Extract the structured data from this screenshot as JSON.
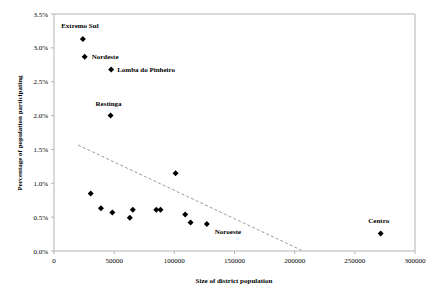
{
  "chart_data": {
    "type": "scatter",
    "title": "",
    "xlabel": "Size of district population",
    "ylabel": "Percentage of population participating",
    "xlim": [
      0,
      300000
    ],
    "ylim": [
      0,
      0.035
    ],
    "grid": false,
    "legend": null,
    "xticks": [
      0,
      50000,
      100000,
      150000,
      200000,
      250000,
      300000
    ],
    "xticklabels": [
      "0",
      "50000",
      "100000",
      "150000",
      "200000",
      "250000",
      "300000"
    ],
    "yticks": [
      0.0,
      0.005,
      0.01,
      0.015,
      0.02,
      0.025,
      0.03,
      0.035
    ],
    "yticklabels": [
      "0.0%",
      "0.5%",
      "1.0%",
      "1.5%",
      "2.0%",
      "2.5%",
      "3.0%",
      "3.5%"
    ],
    "points": [
      {
        "x": 24000,
        "y": 0.0313,
        "label": "Extremo Sul",
        "label_dx": -3,
        "label_dy": -11
      },
      {
        "x": 25500,
        "y": 0.0287,
        "label": "Nordeste",
        "label_dx": 7,
        "label_dy": 2
      },
      {
        "x": 47500,
        "y": 0.0268,
        "label": "Lomba do Pinheiro",
        "label_dx": 6,
        "label_dy": 2
      },
      {
        "x": 47000,
        "y": 0.02,
        "label": "Restinga",
        "label_dx": -2,
        "label_dy": -10
      },
      {
        "x": 30500,
        "y": 0.0085,
        "label": "",
        "label_dx": 0,
        "label_dy": 0
      },
      {
        "x": 39000,
        "y": 0.0063,
        "label": "",
        "label_dx": 0,
        "label_dy": 0
      },
      {
        "x": 48500,
        "y": 0.0057,
        "label": "",
        "label_dx": 0,
        "label_dy": 0
      },
      {
        "x": 63000,
        "y": 0.0049,
        "label": "",
        "label_dx": 0,
        "label_dy": 0
      },
      {
        "x": 65500,
        "y": 0.0061,
        "label": "",
        "label_dx": 0,
        "label_dy": 0
      },
      {
        "x": 85000,
        "y": 0.0061,
        "label": "",
        "label_dx": 0,
        "label_dy": 0
      },
      {
        "x": 88500,
        "y": 0.0061,
        "label": "",
        "label_dx": 0,
        "label_dy": 0
      },
      {
        "x": 101000,
        "y": 0.0115,
        "label": "",
        "label_dx": 0,
        "label_dy": 0
      },
      {
        "x": 109000,
        "y": 0.0054,
        "label": "",
        "label_dx": 0,
        "label_dy": 0
      },
      {
        "x": 113500,
        "y": 0.0042,
        "label": "",
        "label_dx": 0,
        "label_dy": 0
      },
      {
        "x": 127000,
        "y": 0.004,
        "label": "Noroeste",
        "label_dx": 8,
        "label_dy": 10
      },
      {
        "x": 271500,
        "y": 0.0026,
        "label": "Centro",
        "label_dx": -2,
        "label_dy": -10
      }
    ],
    "trendline": {
      "style": "dashed",
      "x_start": 20000,
      "y_start": 0.01565,
      "x_end": 207000,
      "y_end": 0.0
    }
  },
  "colors": {
    "marker": "#000000",
    "frame": "#b4b4b4",
    "trend": "#9a9a9a",
    "background": "#ffffff"
  }
}
